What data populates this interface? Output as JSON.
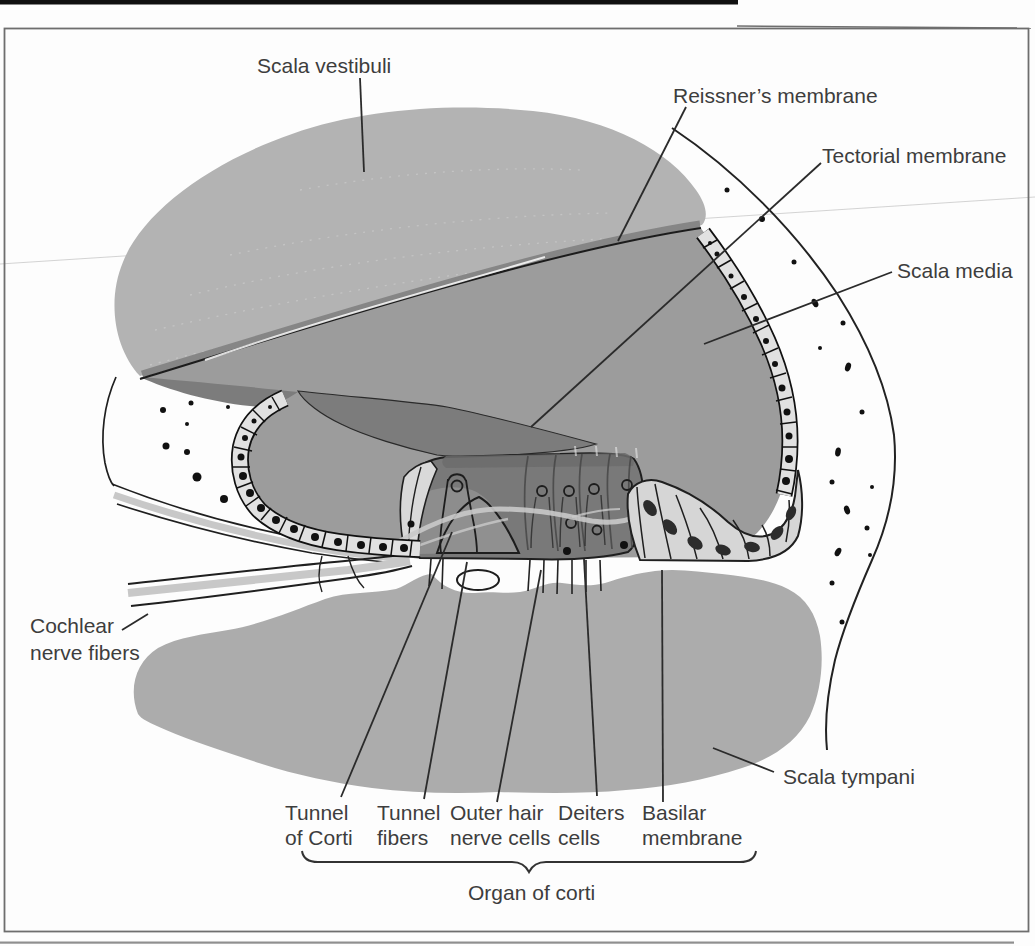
{
  "labels": {
    "scala_vestibuli": "Scala vestibuli",
    "reissners_membrane": "Reissner’s membrane",
    "tectorial_membrane": "Tectorial membrane",
    "scala_media": "Scala media",
    "cochlear_line1": "Cochlear",
    "cochlear_line2": "nerve fibers",
    "scala_tympani": "Scala tympani",
    "tunnel_of_corti_line1": "Tunnel",
    "tunnel_of_corti_line2": "of Corti",
    "tunnel_fibers_line1": "Tunnel",
    "tunnel_fibers_line2": "fibers",
    "outer_hair_line1": "Outer hair",
    "outer_hair_line2": "nerve cells",
    "deiters_line1": "Deiters",
    "deiters_line2": "cells",
    "basilar_line1": "Basilar",
    "basilar_line2": "membrane",
    "organ_of_corti": "Organ of corti"
  },
  "colors": {
    "scala_vestibuli": "#b3b3b3",
    "scala_media": "#9c9c9c",
    "scala_tympani": "#acacac",
    "tectorial_membrane": "#7c7c7c",
    "organ_of_corti": "#797979",
    "cell_light": "#e1e1e1",
    "nerve_band": "#c8c8c8",
    "outline": "#1f1f1f",
    "label_text": "#3d3d3d"
  }
}
